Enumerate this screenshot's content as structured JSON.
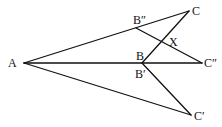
{
  "diagram": {
    "type": "geometry",
    "points": {
      "A": {
        "label": "A",
        "x": 24,
        "y": 63
      },
      "B": {
        "label": "B",
        "x": 142,
        "y": 63
      },
      "Bp": {
        "label": "B′",
        "x": 142,
        "y": 63
      },
      "Bpp": {
        "label": "B″",
        "x": 136,
        "y": 28
      },
      "C": {
        "label": "C",
        "x": 189,
        "y": 11
      },
      "Cp": {
        "label": "C′",
        "x": 191,
        "y": 115
      },
      "Cpp": {
        "label": "C″",
        "x": 202,
        "y": 63
      },
      "X": {
        "label": "X"
      }
    },
    "labels": {
      "A": "A",
      "B": "B",
      "Bp": "B′",
      "Bpp": "B″",
      "C": "C",
      "Cp": "C′",
      "Cpp": "C″",
      "X": "X"
    },
    "segments": [
      [
        "A",
        "C"
      ],
      [
        "A",
        "Cpp"
      ],
      [
        "A",
        "Cp"
      ],
      [
        "B",
        "C"
      ],
      [
        "Bp",
        "Cp"
      ],
      [
        "Bpp",
        "Cpp"
      ]
    ]
  }
}
